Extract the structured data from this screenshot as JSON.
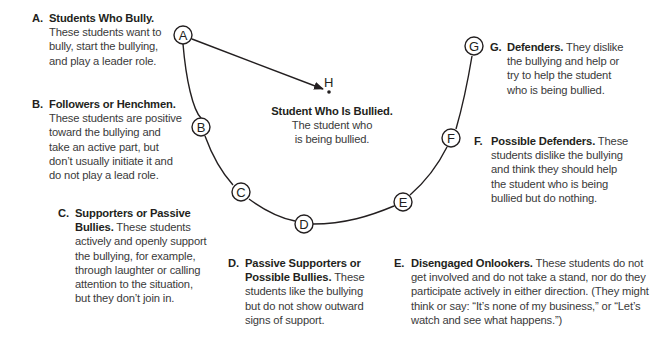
{
  "diagram": {
    "center": {
      "node_label": "H",
      "title": "Student Who Is Bullied.",
      "description_line1": "The student who",
      "description_line2": "is being bullied."
    },
    "nodes": [
      {
        "id": "A",
        "label": "A"
      },
      {
        "id": "B",
        "label": "B"
      },
      {
        "id": "C",
        "label": "C"
      },
      {
        "id": "D",
        "label": "D"
      },
      {
        "id": "E",
        "label": "E"
      },
      {
        "id": "F",
        "label": "F"
      },
      {
        "id": "G",
        "label": "G"
      }
    ],
    "edges": [
      {
        "from": "A",
        "to": "H",
        "type": "arrow"
      },
      {
        "from": "A",
        "to": "G",
        "type": "arc",
        "through": [
          "B",
          "C",
          "D",
          "E",
          "F"
        ]
      }
    ],
    "roles": [
      {
        "letter": "A.",
        "title": "Students Who Bully.",
        "lines": [
          "These students want to",
          "bully, start the bullying,",
          "and play a leader role."
        ]
      },
      {
        "letter": "B.",
        "title": "Followers or Henchmen.",
        "lines": [
          "These students are positive",
          "toward the bullying and",
          "take an active part, but",
          "don’t usually initiate it and",
          "do not play a lead role."
        ]
      },
      {
        "letter": "C.",
        "title_line1": "Supporters or Passive",
        "title_line2": "Bullies.",
        "first_line_rest": " These students",
        "lines": [
          "actively and openly support",
          "the bullying, for example,",
          "through laughter or calling",
          "attention to the situation,",
          "but they don’t join in."
        ]
      },
      {
        "letter": "D.",
        "title_line1": "Passive Supporters or",
        "title_line2": "Possible Bullies.",
        "first_line_rest": " These",
        "lines": [
          "students like the bullying",
          "but do not show outward",
          "signs of support."
        ]
      },
      {
        "letter": "E.",
        "title": "Disengaged Onlookers.",
        "first_line_rest": " These students do not",
        "lines": [
          "get involved and do not take a stand, nor do they",
          "participate actively in either direction. (They might",
          "think or say: “It’s none of my business,” or “Let’s",
          "watch and see what happens.”)"
        ]
      },
      {
        "letter": "F.",
        "title": "Possible Defenders.",
        "first_line_rest": " These",
        "lines": [
          "students dislike the bullying",
          "and think they should help",
          "the student who is being",
          "bullied but do nothing."
        ]
      },
      {
        "letter": "G.",
        "title": "Defenders.",
        "first_line_rest": " They dislike",
        "lines": [
          "the bullying and help or",
          "try to help the student",
          "who is being bullied."
        ]
      }
    ]
  }
}
